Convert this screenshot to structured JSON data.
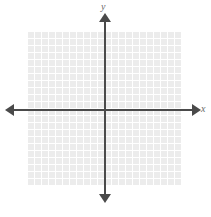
{
  "figure": {
    "title": ""
  },
  "axes": {
    "x_label": "x",
    "y_label": "y",
    "axis_color": "#4a4a4a",
    "arrow_ends": [
      "left",
      "right",
      "up",
      "down"
    ]
  },
  "grid": {
    "cell_size_px": 7,
    "columns": 22,
    "rows": 22,
    "fill_color": "#e9e9e9",
    "line_color": "#ffffff"
  },
  "chart_data": {
    "type": "scatter",
    "title": "",
    "xlabel": "x",
    "ylabel": "y",
    "x": [],
    "y": [],
    "series": [],
    "xlim": [
      -11,
      11
    ],
    "ylim": [
      -11,
      11
    ],
    "grid": true,
    "legend": "none",
    "annotations": []
  }
}
